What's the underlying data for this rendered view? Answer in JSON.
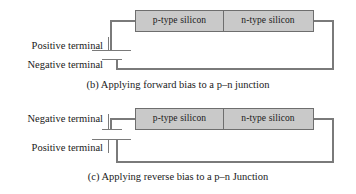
{
  "figures": [
    {
      "id": "forward-bias",
      "bar": {
        "p_label": "p-type silicon",
        "n_label": "n-type silicon"
      },
      "terminals": {
        "upper": "Positive terminal",
        "lower": "Negative terminal"
      },
      "caption": "(b) Applying forward bias to a p–n junction"
    },
    {
      "id": "reverse-bias",
      "bar": {
        "p_label": "p-type silicon",
        "n_label": "n-type silicon"
      },
      "terminals": {
        "upper": "Negative terminal",
        "lower": "Positive terminal"
      },
      "caption": "(c) Applying reverse bias to a p–n Junction"
    }
  ],
  "colors": {
    "silicon_fill": "#c9c9c9",
    "silicon_border": "#6e6e6e",
    "wire": "#7a7a7a",
    "text": "#1a1a1a",
    "background": "#ffffff"
  }
}
